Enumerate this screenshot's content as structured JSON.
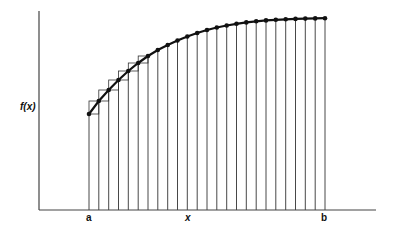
{
  "figure": {
    "type": "riemann-sum-diagram",
    "y_axis_label": "f(x)",
    "x_axis_label": "x",
    "a_label": "a",
    "b_label": "b",
    "interval_count": 24,
    "curve": {
      "description": "increasing concave-down curve from a to b with dot markers at each partition point",
      "points_px": [
        [
          89,
          114
        ],
        [
          98.8,
          101
        ],
        [
          108.7,
          90
        ],
        [
          118.5,
          80
        ],
        [
          128.3,
          71
        ],
        [
          138.2,
          63
        ],
        [
          148,
          56
        ],
        [
          157.8,
          50
        ],
        [
          167.7,
          45
        ],
        [
          177.5,
          40.5
        ],
        [
          187.3,
          36.5
        ],
        [
          197.2,
          33
        ],
        [
          207,
          30
        ],
        [
          216.8,
          27.5
        ],
        [
          226.7,
          25.5
        ],
        [
          236.5,
          23.8
        ],
        [
          246.3,
          22.4
        ],
        [
          256.2,
          21.3
        ],
        [
          266,
          20.4
        ],
        [
          275.8,
          19.8
        ],
        [
          285.7,
          19.3
        ],
        [
          295.5,
          18.9
        ],
        [
          305.3,
          18.6
        ],
        [
          315.2,
          18.4
        ],
        [
          325,
          18.2
        ]
      ]
    },
    "step_boxes_count": 6,
    "colors": {
      "line": "#222222",
      "axis": "#444444",
      "background": "#ffffff"
    }
  }
}
